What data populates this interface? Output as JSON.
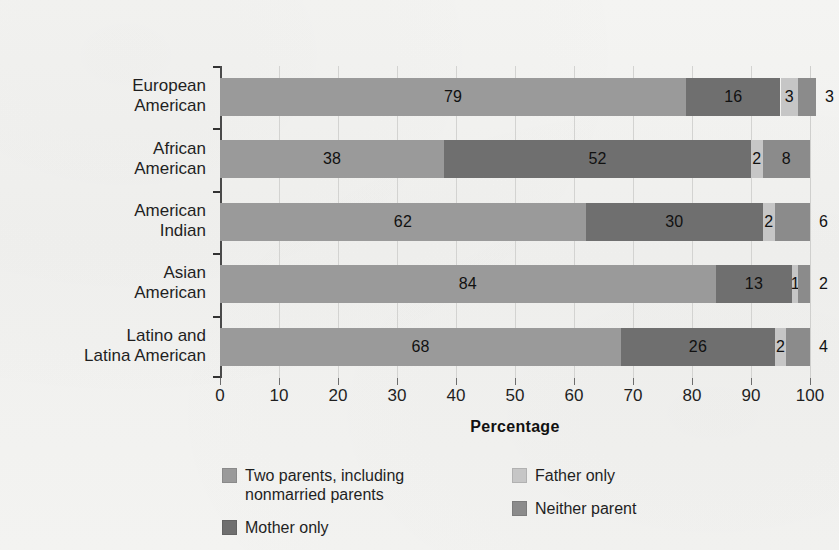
{
  "chart_data": {
    "type": "bar",
    "orientation": "horizontal",
    "stacked": true,
    "title": "",
    "xlabel": "Percentage",
    "ylabel": "",
    "xlim": [
      0,
      100
    ],
    "xticks": [
      0,
      10,
      20,
      30,
      40,
      50,
      60,
      70,
      80,
      90,
      100
    ],
    "xtick_labels": [
      "0",
      "10",
      "20",
      "30",
      "40",
      "50",
      "60",
      "70",
      "80",
      "90",
      "100"
    ],
    "grid": true,
    "grid_axis": "x",
    "legend_position": "bottom",
    "categories": [
      "European\nAmerican",
      "African\nAmerican",
      "American\nIndian",
      "Asian\nAmerican",
      "Latino and\nLatina American"
    ],
    "series": [
      {
        "name": "Two parents, including\nnonmarried parents",
        "color": "#9a9a9a",
        "values": [
          79,
          38,
          62,
          84,
          68
        ]
      },
      {
        "name": "Mother only",
        "color": "#6f6f6f",
        "values": [
          16,
          52,
          30,
          13,
          26
        ]
      },
      {
        "name": "Father only",
        "color": "#c6c6c6",
        "values": [
          3,
          2,
          2,
          1,
          2
        ]
      },
      {
        "name": "Neither parent",
        "color": "#8b8b8b",
        "values": [
          3,
          8,
          6,
          2,
          4
        ]
      }
    ],
    "value_labels": [
      [
        "79",
        "16",
        "3",
        "3"
      ],
      [
        "38",
        "52",
        "2",
        "8"
      ],
      [
        "62",
        "30",
        "2",
        "6"
      ],
      [
        "84",
        "13",
        "1",
        "2"
      ],
      [
        "68",
        "26",
        "2",
        "4"
      ]
    ],
    "last_segment_label_outside": [
      true,
      false,
      false,
      true,
      false
    ]
  },
  "axis": {
    "x_title": "Percentage",
    "tick_labels": [
      "0",
      "10",
      "20",
      "30",
      "40",
      "50",
      "60",
      "70",
      "80",
      "90",
      "100"
    ]
  },
  "categories": [
    {
      "line1": "European",
      "line2": "American"
    },
    {
      "line1": "African",
      "line2": "American"
    },
    {
      "line1": "American",
      "line2": "Indian"
    },
    {
      "line1": "Asian",
      "line2": "American"
    },
    {
      "line1": "Latino and",
      "line2": "Latina American"
    }
  ],
  "legend": {
    "columns": [
      [
        {
          "label": "Two parents, including\nnonmarried parents",
          "color": "#9a9a9a",
          "swatch_name": "legend-swatch-two-parents"
        },
        {
          "label": "Mother only",
          "color": "#6f6f6f",
          "swatch_name": "legend-swatch-mother-only"
        }
      ],
      [
        {
          "label": "Father only",
          "color": "#c6c6c6",
          "swatch_name": "legend-swatch-father-only"
        },
        {
          "label": "Neither parent",
          "color": "#8b8b8b",
          "swatch_name": "legend-swatch-neither-parent"
        }
      ]
    ]
  },
  "colors": {
    "background": "#f2f2f0",
    "gridline": "#d3d3d1",
    "axis": "#323232",
    "text": "#1f1f1f"
  }
}
